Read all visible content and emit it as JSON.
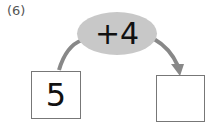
{
  "problem_label": "(6)",
  "operation": "+4",
  "start_value": "5",
  "result_value": "",
  "colors": {
    "ellipse": "#c8c8c8",
    "arrow": "#888888",
    "box_border": "#777777"
  }
}
